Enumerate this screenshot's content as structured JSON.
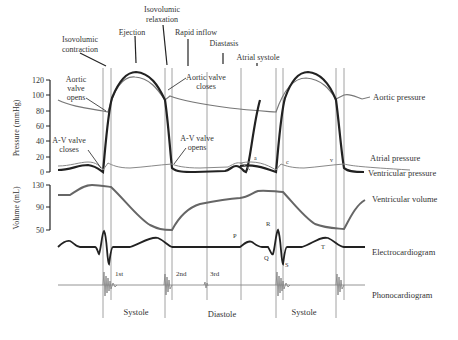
{
  "phases_top": {
    "isovolumic_contraction": [
      "Isovolumic",
      "contraction"
    ],
    "ejection": "Ejection",
    "isovolumic_relaxation": [
      "Isovolumic",
      "relaxation"
    ],
    "rapid_inflow": "Rapid inflow",
    "diastasis": "Diastasis",
    "atrial_systole": "Atrial systole"
  },
  "annotations": {
    "aortic_valve_opens": [
      "Aortic",
      "valve",
      "opens"
    ],
    "av_valve_closes": [
      "A-V valve",
      "closes"
    ],
    "aortic_valve_closes": [
      "Aortic valve",
      "closes"
    ],
    "av_valve_opens": [
      "A-V valve",
      "opens"
    ],
    "wave_a": "a",
    "wave_c": "c",
    "wave_v": "v",
    "ecg_p": "P",
    "ecg_q": "Q",
    "ecg_r": "R",
    "ecg_s": "S",
    "ecg_t": "T",
    "sound_1st": "1st",
    "sound_2nd": "2nd",
    "sound_3rd": "3rd"
  },
  "axes": {
    "pressure_label": "Pressure (mmHg)",
    "pressure_ticks": [
      "120",
      "100",
      "80",
      "60",
      "40",
      "20",
      "0"
    ],
    "volume_label": "Volume (mL)",
    "volume_ticks": [
      "130",
      "90",
      "50"
    ]
  },
  "trace_labels": {
    "aortic_pressure": "Aortic pressure",
    "atrial_pressure": "Atrial pressure",
    "ventricular_pressure": "Ventricular pressure",
    "ventricular_volume": "Ventricular volume",
    "electrocardiogram": "Electrocardiogram",
    "phonocardiogram": "Phonocardiogram"
  },
  "phases_bottom": {
    "systole_1": "Systole",
    "diastole": "Diastole",
    "systole_2": "Systole"
  },
  "colors": {
    "ventricular": "#222222",
    "aortic": "#777777",
    "atrial": "#888888",
    "volume": "#666666",
    "ecg": "#222222",
    "phono": "#888888",
    "grid": "#8a8a8a"
  }
}
